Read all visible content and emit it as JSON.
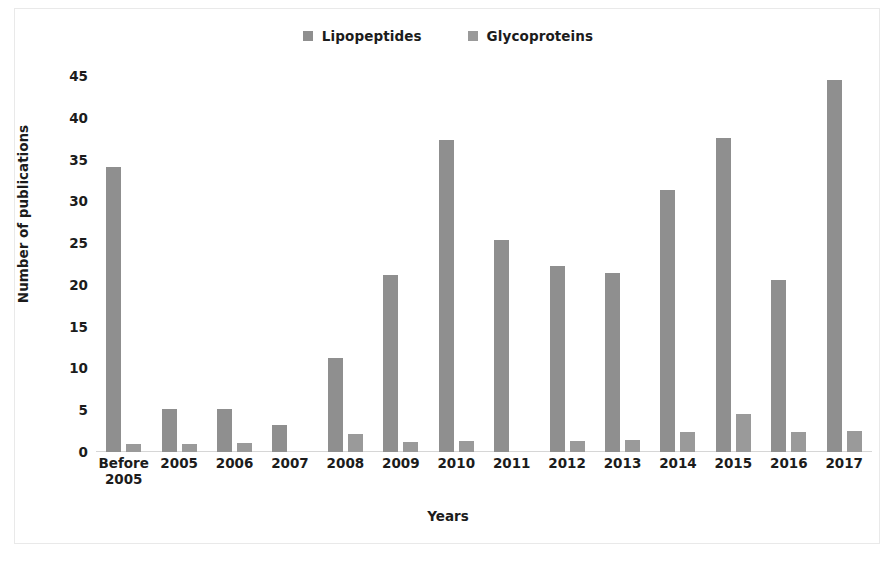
{
  "chart_data": {
    "type": "bar",
    "title": "",
    "xlabel": "Years",
    "ylabel": "Number of publications",
    "ylim": [
      0,
      45
    ],
    "yticks": [
      0,
      5,
      10,
      15,
      20,
      25,
      30,
      35,
      40,
      45
    ],
    "grid": false,
    "legend_position": "top-center",
    "categories": [
      "Before\n2005",
      "2005",
      "2006",
      "2007",
      "2008",
      "2009",
      "2010",
      "2011",
      "2012",
      "2013",
      "2014",
      "2015",
      "2016",
      "2017"
    ],
    "series": [
      {
        "name": "Lipopeptides",
        "color": "#8f8f8f",
        "values": [
          34.1,
          5.2,
          5.2,
          3.2,
          11.2,
          21.2,
          37.4,
          25.4,
          22.3,
          21.4,
          31.4,
          37.6,
          20.6,
          44.5
        ]
      },
      {
        "name": "Glycoproteins",
        "color": "#9a9a9a",
        "values": [
          1.0,
          1.0,
          1.1,
          0.0,
          2.2,
          1.2,
          1.3,
          0.0,
          1.3,
          1.4,
          2.4,
          4.5,
          2.4,
          2.5
        ]
      }
    ]
  },
  "legend": {
    "entries": [
      {
        "label": "Lipopeptides",
        "color": "#8f8f8f"
      },
      {
        "label": "Glycoproteins",
        "color": "#9a9a9a"
      }
    ]
  },
  "axes": {
    "y_title": "Number of publications",
    "x_title": "Years"
  },
  "colors": {
    "series_a": "#8f8f8f",
    "series_b": "#9a9a9a",
    "text": "#1c1c1c",
    "background": "#ffffff",
    "frame": "#e9e9e9"
  }
}
